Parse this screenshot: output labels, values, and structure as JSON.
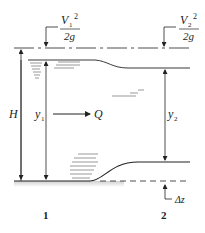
{
  "diagram": {
    "labels": {
      "v1_num": "V",
      "v1_sub": "1",
      "v1_sup": "2",
      "v1_den": "2g",
      "v2_num": "V",
      "v2_sub": "2",
      "v2_sup": "2",
      "v2_den": "2g",
      "H": "H",
      "y1": "y",
      "y1_sub": "1",
      "y2": "y",
      "y2_sub": "2",
      "Q": "Q",
      "dz": "Δz",
      "section1": "1",
      "section2": "2"
    },
    "colors": {
      "line": "#222222",
      "ground": "#d9d9d9",
      "water_hatch": "#555555"
    }
  }
}
